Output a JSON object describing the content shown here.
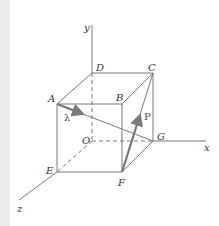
{
  "diagram": {
    "axes": {
      "x": "x",
      "y": "y",
      "z": "z",
      "origin": "O"
    },
    "vertices": {
      "A": "A",
      "B": "B",
      "C": "C",
      "D": "D",
      "E": "E",
      "F": "F",
      "G": "G"
    },
    "vectors": {
      "lambda": "λ",
      "P": "P"
    },
    "colors": {
      "line": "#6b6b6b",
      "vector": "#7a7a7a",
      "background": "#ffffff",
      "strip": "#ececec"
    }
  }
}
